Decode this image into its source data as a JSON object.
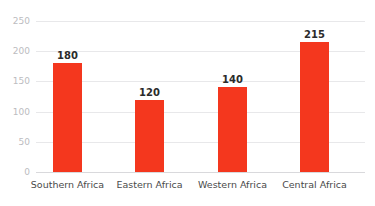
{
  "chart_data": {
    "type": "bar",
    "title": "",
    "subtitle": "",
    "xlabel": "",
    "ylabel": "",
    "categories": [
      "Southern Africa",
      "Eastern Africa",
      "Western Africa",
      "Central Africa"
    ],
    "values": [
      180,
      120,
      140,
      215
    ],
    "value_labels": [
      "180",
      "120",
      "140",
      "215"
    ],
    "ylim": [
      0,
      250
    ],
    "yticks": [
      0,
      50,
      100,
      150,
      200,
      250
    ],
    "ytick_labels": [
      "0",
      "50",
      "100",
      "150",
      "200",
      "250"
    ],
    "grid": true,
    "grid_axis": "y",
    "legend": false,
    "legend_position": "none",
    "series": [
      {
        "name": "",
        "values": [
          180,
          120,
          140,
          215
        ]
      }
    ]
  },
  "style": {
    "bar_color": "#f4371e",
    "grid_color": "#e8e8ea",
    "baseline_color": "#d9d9dc",
    "ytick_color": "#bcbcc0",
    "category_color": "#4a4a4a",
    "value_label_color": "#2b2b2b",
    "background": "#ffffff"
  }
}
